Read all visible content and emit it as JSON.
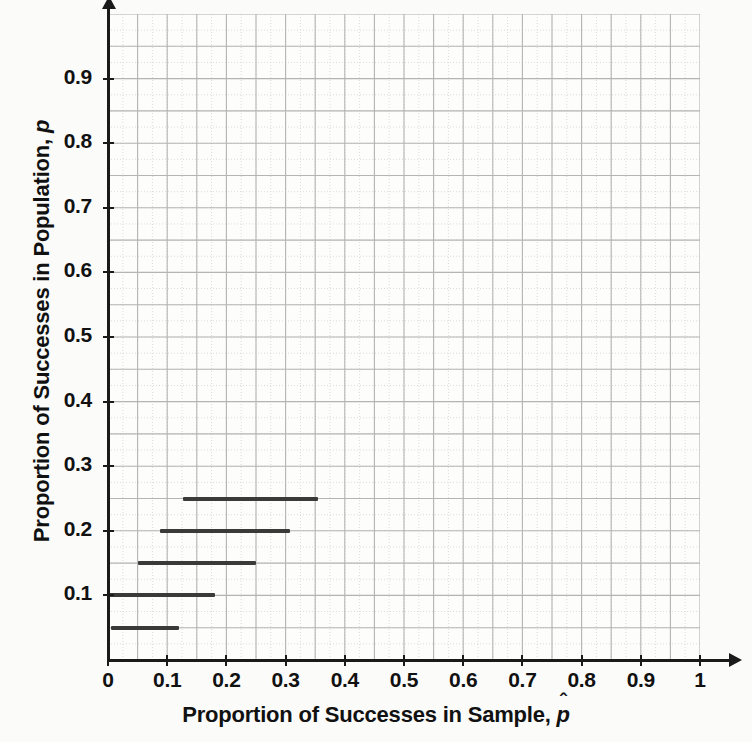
{
  "chart_data": {
    "type": "line",
    "title": "",
    "xlabel": "Proportion of Successes in Sample, p̂",
    "ylabel": "Proportion of Successes in Population, p",
    "xlim": [
      0,
      1
    ],
    "ylim": [
      0,
      1
    ],
    "grid": true,
    "grid_major_step": 0.05,
    "grid_minor_step": 0.025,
    "legend": "none",
    "x_ticks": [
      "0",
      "0.1",
      "0.2",
      "0.3",
      "0.4",
      "0.5",
      "0.6",
      "0.7",
      "0.8",
      "0.9",
      "1"
    ],
    "x_tick_values": [
      0,
      0.1,
      0.2,
      0.3,
      0.4,
      0.5,
      0.6,
      0.7,
      0.8,
      0.9,
      1
    ],
    "y_ticks": [
      "0.1",
      "0.2",
      "0.3",
      "0.4",
      "0.5",
      "0.6",
      "0.7",
      "0.8",
      "0.9"
    ],
    "y_tick_values": [
      0.1,
      0.2,
      0.3,
      0.4,
      0.5,
      0.6,
      0.7,
      0.8,
      0.9
    ],
    "series": [
      {
        "name": "confidence-intervals",
        "orientation": "horizontal",
        "color": "#3a3a3a",
        "intervals": [
          {
            "p": 0.05,
            "x_start": 0.005,
            "x_end": 0.12
          },
          {
            "p": 0.1,
            "x_start": 0.0,
            "x_end": 0.18
          },
          {
            "p": 0.15,
            "x_start": 0.05,
            "x_end": 0.25
          },
          {
            "p": 0.2,
            "x_start": 0.088,
            "x_end": 0.307
          },
          {
            "p": 0.25,
            "x_start": 0.127,
            "x_end": 0.355
          }
        ]
      }
    ]
  },
  "axes": {
    "x_title_prefix": "Proportion of Successes in Sample, ",
    "x_title_symbol": "p",
    "x_title_hat": "ˆ",
    "y_title_prefix": "Proportion of Successes in Population, ",
    "y_title_symbol": "p"
  },
  "colors": {
    "segment": "#3a3a3a",
    "axis": "#1a1a1a",
    "grid_major": "#b4b4b4",
    "grid_minor": "#dcdcdc",
    "background": "#fdfdfc",
    "text": "#111111"
  }
}
